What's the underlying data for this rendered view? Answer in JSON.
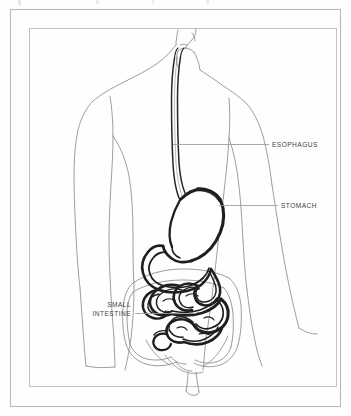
{
  "figure": {
    "kind": "anatomical-illustration",
    "view": "anterior-torso-outline",
    "style": "line-drawing",
    "background_color": "#fefefe",
    "outline_color": "#8d8d92",
    "organ_outline_color": "#2b2b2b",
    "label_color": "#3f3f42",
    "leader_color": "#9a9a9e",
    "frame": {
      "outer_border_color": "#b9b9bd",
      "inner_border_color": "#b9b9bd"
    }
  },
  "labels": [
    {
      "id": "esophagus",
      "text": "ESOPHAGUS",
      "anchor": "start",
      "text_x": 272,
      "text_y": 147,
      "leader": {
        "x1": 173,
        "y1": 144.5,
        "x2": 269,
        "y2": 144.5
      }
    },
    {
      "id": "stomach",
      "text": "STOMACH",
      "anchor": "start",
      "text_x": 281,
      "text_y": 208,
      "leader": {
        "x1": 219,
        "y1": 205.5,
        "x2": 278,
        "y2": 205.5
      }
    },
    {
      "id": "small-intestine",
      "line1": "SMALL",
      "line2": "INTESTINE",
      "anchor": "end",
      "text_x": 131,
      "text_y_line1": 307,
      "text_y_line2": 316,
      "leader": {
        "x1": 135,
        "y1": 313.5,
        "x2": 196,
        "y2": 313.5
      }
    }
  ],
  "organs": [
    {
      "id": "esophagus",
      "name": "Esophagus",
      "emphasis": "dark-tube"
    },
    {
      "id": "stomach",
      "name": "Stomach",
      "emphasis": "dark-outline-j-shape"
    },
    {
      "id": "duodenum",
      "name": "Duodenum",
      "emphasis": "dark-tube"
    },
    {
      "id": "small-intestine",
      "name": "Small intestine",
      "emphasis": "dark-coiled-tube"
    },
    {
      "id": "large-intestine",
      "name": "Large intestine",
      "emphasis": "light-outline"
    }
  ]
}
